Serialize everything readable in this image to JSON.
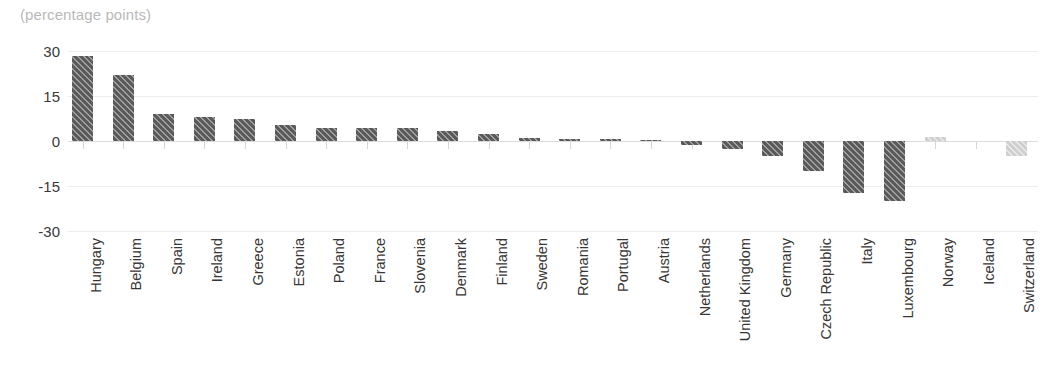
{
  "chart_data": {
    "type": "bar",
    "title": "(percentage points)",
    "xlabel": "",
    "ylabel": "",
    "ylim": [
      -30,
      30
    ],
    "yticks": [
      30,
      15,
      0,
      -15,
      -30
    ],
    "ytick_labels": [
      "30",
      "15",
      "0",
      "-15",
      "-30"
    ],
    "grid": true,
    "legend": "none",
    "orientation": "vertical",
    "categories": [
      "Hungary",
      "Belgium",
      "Spain",
      "Ireland",
      "Greece",
      "Estonia",
      "Poland",
      "France",
      "Slovenia",
      "Denmark",
      "Finland",
      "Sweden",
      "Romania",
      "Portugal",
      "Austria",
      "Netherlands",
      "United Kingdom",
      "Germany",
      "Czech Republic",
      "Italy",
      "Luxembourg",
      "Norway",
      "Iceland",
      "Switzerland"
    ],
    "values": [
      28.5,
      22.0,
      9.0,
      8.0,
      7.5,
      5.5,
      4.5,
      4.3,
      4.2,
      3.3,
      2.3,
      1.0,
      0.7,
      0.6,
      0.3,
      -1.3,
      -2.5,
      -5.0,
      -10.0,
      -17.3,
      -20.0,
      1.5,
      0.0,
      -5.0
    ],
    "bar_styles": [
      "dark",
      "dark",
      "dark",
      "dark",
      "dark",
      "dark",
      "dark",
      "dark",
      "dark",
      "dark",
      "dark",
      "dark",
      "dark",
      "dark",
      "dark",
      "dark",
      "dark",
      "dark",
      "dark",
      "dark",
      "dark",
      "light",
      "light",
      "light"
    ],
    "colors": {
      "bar_dark": "#5a5a5a",
      "bar_light": "#cfcfcf",
      "gridline": "#ededed",
      "zero_line": "#dcdcdc",
      "tick_label": "#3a3a3a",
      "category_label": "#363636",
      "title": "#b9b9b9",
      "background": "#ffffff"
    }
  }
}
